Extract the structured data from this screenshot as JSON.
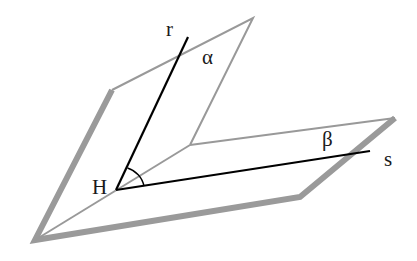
{
  "diagram": {
    "labels": {
      "r": "r",
      "alpha": "α",
      "beta": "β",
      "s": "s",
      "H": "H"
    },
    "colors": {
      "plane_edge": "#999999",
      "plane_thick_edge": "#9a9a9a",
      "lines": "#000000",
      "text": "#1a1a1a",
      "background": "#ffffff"
    }
  }
}
